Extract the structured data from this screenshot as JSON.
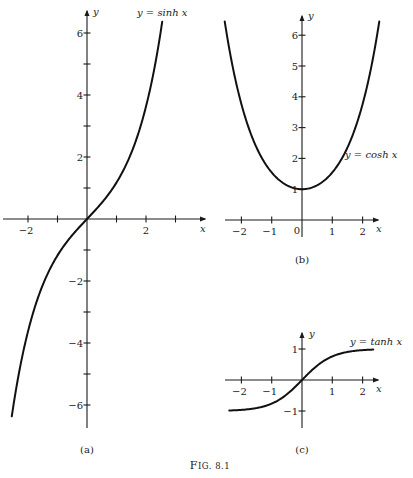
{
  "figure": {
    "caption": "Fig. 8.1",
    "caption_first": "F",
    "caption_rest": "IG. 8.1"
  },
  "chart_data": [
    {
      "type": "line",
      "panel": "(a)",
      "title": "y = sinh x",
      "xlabel": "x",
      "ylabel": "y",
      "function": "sinh",
      "x_range": [
        -2.55,
        2.55
      ],
      "xlim": [
        -2.9,
        3.0
      ],
      "ylim": [
        -6.8,
        6.6
      ],
      "x_ticks": [
        -2,
        -1,
        1,
        2,
        3
      ],
      "x_tick_labels": [
        "-2",
        "",
        "",
        "2",
        ""
      ],
      "y_ticks": [
        -6,
        -5,
        -4,
        -3,
        -2,
        -1,
        1,
        2,
        3,
        4,
        5,
        6
      ],
      "y_tick_labels": [
        "-6",
        "",
        "-4",
        "",
        "-2",
        "",
        "",
        "2",
        "",
        "4",
        "",
        "6"
      ],
      "grid": false,
      "points": {
        "x": [
          -2.5,
          -2,
          -1,
          0,
          1,
          2,
          2.5
        ],
        "y": [
          -6.05,
          -3.63,
          -1.18,
          0,
          1.18,
          3.63,
          6.05
        ]
      }
    },
    {
      "type": "line",
      "panel": "(b)",
      "title": "y = cosh x",
      "xlabel": "x",
      "ylabel": "y",
      "function": "cosh",
      "x_range": [
        -2.55,
        2.55
      ],
      "xlim": [
        -2.6,
        2.6
      ],
      "ylim": [
        -0.3,
        6.6
      ],
      "x_ticks": [
        -2,
        -1,
        1,
        2
      ],
      "x_tick_labels": [
        "-2",
        "-1",
        "1",
        "2"
      ],
      "origin_label": "0",
      "y_ticks": [
        1,
        2,
        3,
        4,
        5,
        6
      ],
      "y_tick_labels": [
        "1",
        "2",
        "3",
        "4",
        "5",
        "6"
      ],
      "grid": false,
      "points": {
        "x": [
          -2.5,
          -2,
          -1,
          0,
          1,
          2,
          2.5
        ],
        "y": [
          6.13,
          3.76,
          1.54,
          1,
          1.54,
          3.76,
          6.13
        ]
      }
    },
    {
      "type": "line",
      "panel": "(c)",
      "title": "y = tanh x",
      "xlabel": "x",
      "ylabel": "y",
      "function": "tanh",
      "x_range": [
        -2.4,
        2.35
      ],
      "xlim": [
        -2.6,
        2.6
      ],
      "ylim": [
        -1.5,
        1.5
      ],
      "x_ticks": [
        -2,
        -1,
        1,
        2
      ],
      "x_tick_labels": [
        "-2",
        "-1",
        "1",
        "2"
      ],
      "y_ticks": [
        -1,
        1
      ],
      "y_tick_labels": [
        "-1",
        "1"
      ],
      "grid": false,
      "points": {
        "x": [
          -2,
          -1,
          0,
          1,
          2
        ],
        "y": [
          -0.96,
          -0.76,
          0,
          0.76,
          0.96
        ]
      }
    }
  ],
  "layout": {
    "panels": [
      {
        "ox": 87,
        "oy": 219,
        "sx": 29.5,
        "sy": 31,
        "x_axis": [
          3,
          205
        ],
        "y_axis": [
          11,
          428
        ],
        "label_pos": [
          87,
          453
        ],
        "title_pos": [
          137,
          16
        ],
        "xlabel_pos": [
          200,
          232
        ],
        "ylabel_pos": [
          93,
          15
        ]
      },
      {
        "ox": 302,
        "oy": 220,
        "sx": 30.3,
        "sy": 30.8,
        "x_axis": [
          225,
          378
        ],
        "y_axis": [
          16,
          237
        ],
        "label_pos": [
          302,
          263
        ],
        "title_pos": [
          345,
          158
        ],
        "xlabel_pos": [
          376,
          232
        ],
        "ylabel_pos": [
          308,
          19
        ]
      },
      {
        "ox": 302,
        "oy": 380,
        "sx": 30.3,
        "sy": 31,
        "x_axis": [
          225,
          378
        ],
        "y_axis": [
          333,
          428
        ],
        "label_pos": [
          302,
          453
        ],
        "title_pos": [
          350,
          345
        ],
        "xlabel_pos": [
          376,
          392
        ],
        "ylabel_pos": [
          309,
          337
        ]
      }
    ],
    "caption_pos": [
      210,
      469
    ]
  }
}
